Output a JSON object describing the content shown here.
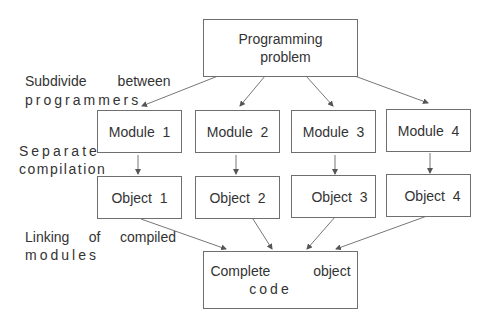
{
  "diagram": {
    "top_box": {
      "line1": "Programming",
      "line2": "problem"
    },
    "modules": [
      {
        "label": "Module  1"
      },
      {
        "label": "Module  2"
      },
      {
        "label": "Module  3"
      },
      {
        "label": "Module  4"
      }
    ],
    "objects": [
      {
        "label": "Object  1"
      },
      {
        "label": "Object  2"
      },
      {
        "label": "Object  3"
      },
      {
        "label": "Object  4"
      }
    ],
    "bottom_box": {
      "line1": "Complete           object",
      "line2": "code"
    },
    "annotations": {
      "subdivide_line1": "Subdivide        between",
      "subdivide_line2": "programmers",
      "separate_line1": "Separate",
      "separate_line2": "compilation",
      "linking_line1": "Linking     of     compiled",
      "linking_line2": "modules"
    },
    "colors": {
      "line": "#6f6f6f",
      "text": "#333333",
      "background": "#ffffff"
    }
  }
}
